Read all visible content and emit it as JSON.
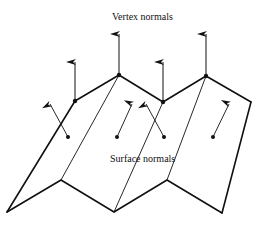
{
  "labels": {
    "vertex_normals": "Vertex normals",
    "surface_normals": "Surface normals"
  },
  "colors": {
    "stroke": "#111111",
    "background": "#ffffff"
  }
}
